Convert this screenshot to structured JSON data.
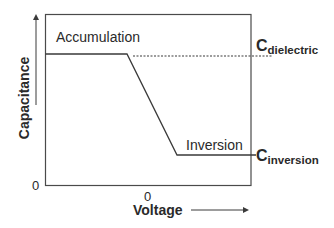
{
  "diagram": {
    "regions": {
      "accumulation": "Accumulation",
      "inversion": "Inversion"
    },
    "axes": {
      "x_label": "Voltage",
      "y_label": "Capacitance",
      "x_zero": "0",
      "y_zero": "0"
    },
    "levels": {
      "dielectric": {
        "main": "C",
        "sub": "dielectric"
      },
      "inversion": {
        "main": "C",
        "sub": "inversion"
      }
    },
    "colors": {
      "line": "#3a3a3a",
      "text": "#2a2a2a",
      "background": "#ffffff"
    }
  }
}
